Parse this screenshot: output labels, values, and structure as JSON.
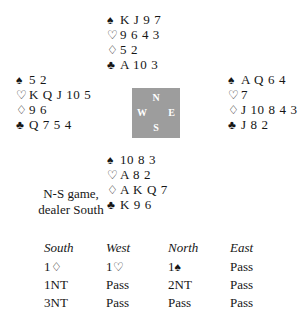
{
  "suits": {
    "spade": "♠",
    "heart": "♡",
    "diamond": "♢",
    "club": "♣"
  },
  "hands": {
    "north": {
      "label": "North",
      "spades": "K J 9 7",
      "hearts": "9 6 4 3",
      "diamonds": "5 2",
      "clubs": "A 10 3"
    },
    "west": {
      "label": "West",
      "spades": "5 2",
      "hearts": "K Q J 10 5",
      "diamonds": "9 6",
      "clubs": "Q 7 5 4"
    },
    "east": {
      "label": "East",
      "spades": "A Q 6 4",
      "hearts": "7",
      "diamonds": "J 10 8 4 3",
      "clubs": "J 8 2"
    },
    "south": {
      "label": "South",
      "spades": "10 8 3",
      "hearts": "A 8 2",
      "diamonds": "A K Q 7",
      "clubs": "K 9 6"
    }
  },
  "compass": {
    "north": "N",
    "west": "W",
    "east": "E",
    "south": "S",
    "background_color": "#9d9d9d"
  },
  "conditions": {
    "line1": "N-S game,",
    "line2": "dealer South"
  },
  "auction": {
    "headers": [
      "South",
      "West",
      "North",
      "East"
    ],
    "rows": [
      [
        {
          "level": "1",
          "suit": "♢",
          "text": ""
        },
        {
          "level": "1",
          "suit": "♡",
          "text": ""
        },
        {
          "level": "1",
          "suit": "♠",
          "text": ""
        },
        {
          "level": "",
          "suit": "",
          "text": "Pass"
        }
      ],
      [
        {
          "level": "",
          "suit": "",
          "text": "1NT"
        },
        {
          "level": "",
          "suit": "",
          "text": "Pass"
        },
        {
          "level": "",
          "suit": "",
          "text": "2NT"
        },
        {
          "level": "",
          "suit": "",
          "text": "Pass"
        }
      ],
      [
        {
          "level": "",
          "suit": "",
          "text": "3NT"
        },
        {
          "level": "",
          "suit": "",
          "text": "Pass"
        },
        {
          "level": "",
          "suit": "",
          "text": "Pass"
        },
        {
          "level": "",
          "suit": "",
          "text": "Pass"
        }
      ]
    ]
  }
}
